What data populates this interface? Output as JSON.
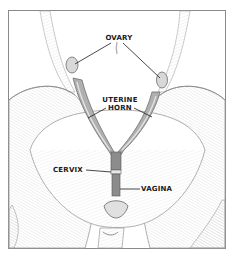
{
  "figure": {
    "labels": {
      "ovary": "OVARY",
      "uterine_horn_line1": "UTERINE",
      "uterine_horn_line2": "HORN",
      "cervix": "CERVIX",
      "vagina": "VAGINA"
    },
    "colors": {
      "frame": "#8a8a8a",
      "sketch_line": "#9a9a9a",
      "shading": "#c8c8c8",
      "organ": "#8c8c8c",
      "leader_line": "#1a1a1a",
      "background": "#ffffff"
    }
  }
}
